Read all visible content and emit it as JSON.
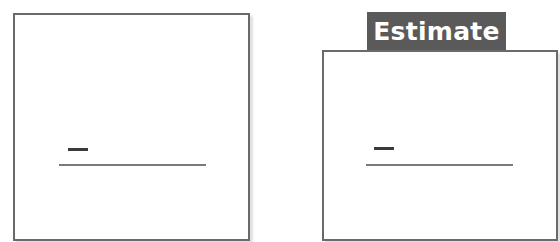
{
  "left_panel": {
    "label": "",
    "short_line": "dash",
    "long_line": "answer-line"
  },
  "right_panel": {
    "tab_label": "Estimate",
    "short_line": "dash",
    "long_line": "answer-line"
  },
  "colors": {
    "border": "#6a6a6a",
    "tab_background": "#5a5a5a",
    "tab_text": "#ffffff",
    "short_line": "#3a3a3a",
    "long_line": "#7a7a7a"
  }
}
